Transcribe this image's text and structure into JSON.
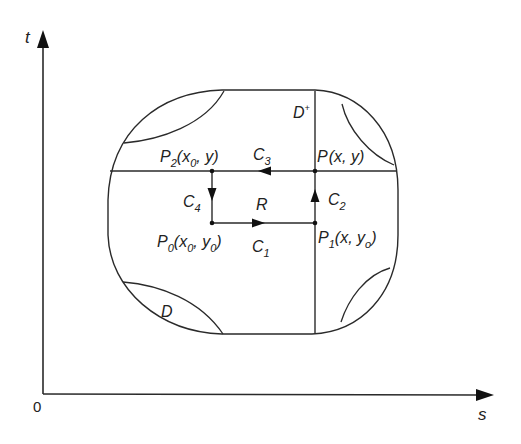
{
  "axes": {
    "vertical_label": "t",
    "horizontal_label": "s",
    "origin_label": "0"
  },
  "regions": {
    "outer_domain": "D",
    "outer_domain_sup": "+",
    "outer_domain_base": "D",
    "inner_region": "R",
    "inner_domain": "D"
  },
  "points": {
    "p": {
      "name": "P",
      "coords": "(x, y)"
    },
    "p0": {
      "name": "P",
      "sub": "0",
      "open": "(x",
      "xsub": "0",
      "mid": ", y",
      "ysub": "0",
      "close": ")"
    },
    "p1": {
      "name": "P",
      "sub": "1",
      "open": "(x, y",
      "ysub": "o",
      "close": ")"
    },
    "p2": {
      "name": "P",
      "sub": "2",
      "open": "(x",
      "xsub": "0",
      "close": ", y)"
    }
  },
  "curves": {
    "c1": {
      "name": "C",
      "sub": "1"
    },
    "c2": {
      "name": "C",
      "sub": "2"
    },
    "c3": {
      "name": "C",
      "sub": "3"
    },
    "c4": {
      "name": "C",
      "sub": "4"
    }
  },
  "colors": {
    "stroke": "#2a2a2a",
    "background": "#ffffff"
  }
}
